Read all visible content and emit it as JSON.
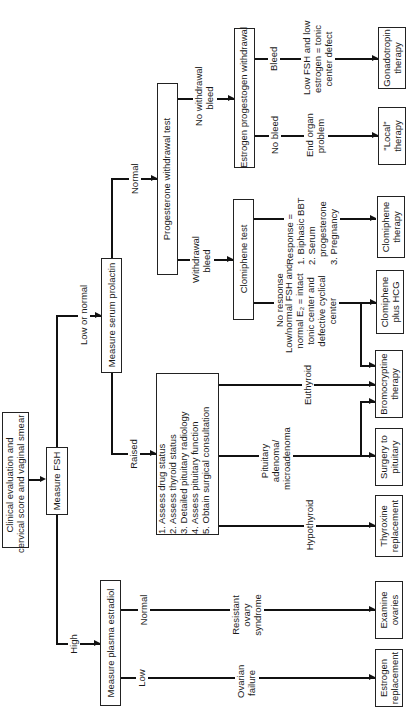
{
  "diagram": {
    "orientation": "rotated-90-ccw",
    "nodes": {
      "start": "Clinical evaluation and\ncervical score and vaginal smear",
      "fsh": "Measure FSH",
      "prolactin": "Measure serum prolactin",
      "estradiol": "Measure plasma estradiol",
      "raised_steps": "1. Assess drug status\n2. Assess thyroid status\n3. Detailed pituitary radiology\n4. Assess pituitary function\n5. Obtain surgical consultation",
      "progesterone": "Progesterone withdrawal test",
      "estrogen_prog": "Estrogen progestogen withdrawal",
      "clomiphene_test": "Clomiphene test",
      "gonadotropin": "Gonadotropin\ntherapy",
      "local": "\"Local\"\ntherapy",
      "clomiphene_therapy": "Clomiphene\ntherapy",
      "clomiphene_hcg": "Clomiphene\nplus HCG",
      "bromocriptine": "Bromocryptine\ntherapy",
      "surgery": "Surgery to\npituitary",
      "thyroxine": "Thyroxine\nreplacement",
      "examine_ovaries": "Examine\novaries",
      "estrogen_replacement": "Estrogen\nreplacement"
    },
    "edge_labels": {
      "high": "High",
      "low_or_normal": "Low or normal",
      "raised": "Raised",
      "normal_prl": "Normal",
      "estradiol_low": "Low",
      "estradiol_normal": "Normal",
      "ovarian_failure": "Ovarian\nfailure",
      "resistant_ovary": "Resistant\novary\nsyndrome",
      "hypothyroid": "Hypothyroid",
      "pituitary_adenoma": "Pituitary\nadenoma/\nmicroadenoma",
      "euthyroid": "Euthyroid",
      "withdrawal_bleed": "Withdrawal\nbleed",
      "no_withdrawal_bleed": "No withdrawal\nbleed",
      "no_response": "No response",
      "no_response_desc": "Low/normal FSH and\nnormal E₂ = intact\ntonic center and\ndefective cyclical\ncenter",
      "response_desc": "Response =\n1. Biphasic BBT\n2. Serum\n   progesterone\n3. Pregnancy",
      "no_bleed": "No bleed",
      "end_organ": "End organ\nproblem",
      "bleed": "Bleed",
      "tonic_defect": "Low FSH and low\nestrogen = tonic\ncenter defect"
    }
  }
}
